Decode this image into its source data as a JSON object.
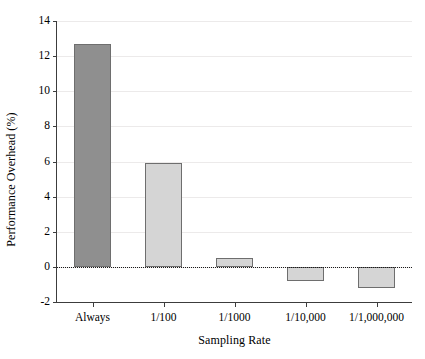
{
  "chart_data": {
    "type": "bar",
    "title": "",
    "subtitle": "",
    "xlabel": "Sampling Rate",
    "ylabel": "Performance Overhead (%)",
    "categories": [
      "Always",
      "1/100",
      "1/1000",
      "1/10,000",
      "1/1,000,000"
    ],
    "values": [
      12.7,
      5.9,
      0.5,
      -0.8,
      -1.2
    ],
    "series": [
      {
        "name": "Performance Overhead (%)",
        "values": [
          12.7,
          5.9,
          0.5,
          -0.8,
          -1.2
        ]
      }
    ],
    "ylim": [
      -2,
      14
    ],
    "yticks": [
      -2,
      0,
      2,
      4,
      6,
      8,
      10,
      12,
      14
    ],
    "ytick_labels": [
      "-2",
      "0",
      "2",
      "4",
      "6",
      "8",
      "10",
      "12",
      "14"
    ],
    "xtick_labels": [
      "Always",
      "1/100",
      "1/1000",
      "1/10,000",
      "1/1,000,000"
    ],
    "grid": true,
    "grid_axis": "y",
    "legend": false,
    "legend_position": "none",
    "zero_reference_line": {
      "value": 0,
      "style": "dotted",
      "color": "#1a1a1a"
    },
    "bar_colors": [
      "#8f8f8f",
      "#d5d5d5",
      "#d5d5d5",
      "#d5d5d5",
      "#d5d5d5"
    ],
    "bar_edge_color": "#6e6e6e",
    "grid_color": "#eceaea",
    "axis_color": "#3c3c3c",
    "text_color": "#000000",
    "background_color": "#ffffff"
  }
}
